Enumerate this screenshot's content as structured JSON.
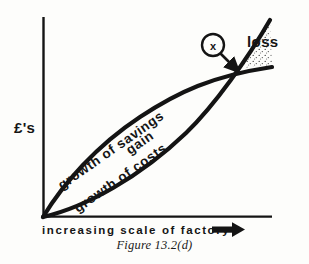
{
  "figure": {
    "caption": "Figure 13.2(d)",
    "axes": {
      "y_label": "£'s",
      "x_label": "increasing scale of factory",
      "x_arrow_icon": "right-arrow-icon",
      "x_origin": 43,
      "y_origin": 217,
      "x_end": 272,
      "y_top": 17
    },
    "curves": [
      {
        "name": "growth-of-savings",
        "label": "growth  of  savings",
        "shape": "concave-down",
        "color": "#141414",
        "label_rotation": -34,
        "points": [
          [
            43,
            217
          ],
          [
            80,
            170
          ],
          [
            120,
            132
          ],
          [
            165,
            102
          ],
          [
            205,
            83
          ],
          [
            236,
            70
          ],
          [
            272,
            67
          ]
        ]
      },
      {
        "name": "growth-of-costs",
        "label": "growth  of  costs",
        "shape": "concave-up",
        "color": "#141414",
        "label_rotation": -34,
        "points": [
          [
            43,
            217
          ],
          [
            85,
            203
          ],
          [
            125,
            183
          ],
          [
            165,
            154
          ],
          [
            200,
            115
          ],
          [
            225,
            87
          ],
          [
            236,
            70
          ],
          [
            270,
            20
          ]
        ]
      }
    ],
    "regions": [
      {
        "name": "gain",
        "label": "gain",
        "fill": "none",
        "label_rotation": -34
      },
      {
        "name": "loss",
        "label": "loss",
        "fill": "stipple"
      }
    ],
    "marker": {
      "name": "crossover-marker",
      "label": "x",
      "cx": 213,
      "cy": 45,
      "r": 11,
      "arrow_to": [
        236,
        70
      ]
    },
    "colors": {
      "ink": "#141414",
      "paper": "#fdfdfb",
      "stipple": "#4a4a4a"
    }
  }
}
